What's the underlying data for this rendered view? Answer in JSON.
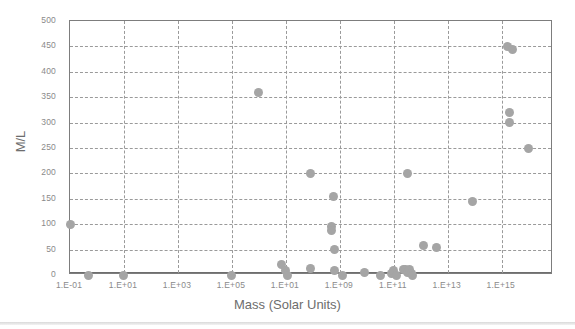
{
  "chart_data": {
    "type": "scatter",
    "title": "",
    "xlabel": "Mass (Solar Units)",
    "ylabel": "M/L",
    "grid": true,
    "legend": false,
    "x_tick_labels": [
      "1.E-01",
      "1.E+01",
      "1.E+03",
      "1.E+05",
      "1.E+01",
      "1.E+09",
      "1.E+11",
      "1.E+13",
      "1.E+15"
    ],
    "x_tick_exponents": [
      -1,
      1,
      3,
      5,
      7,
      9,
      11,
      13,
      15
    ],
    "y_tick_labels": [
      "0",
      "50",
      "100",
      "150",
      "200",
      "250",
      "300",
      "350",
      "400",
      "450",
      "500"
    ],
    "ylim": [
      0,
      500
    ],
    "xlim_exponents": [
      -1,
      16.9
    ],
    "marker_color": "#a5a5a5",
    "grid_color": "#9a9a9a",
    "axis_color": "#7d7d7d",
    "label_color": "#8a8a8a",
    "title_color": "#6d6d6d",
    "points": [
      {
        "xexp": -1.0,
        "y": 100
      },
      {
        "xexp": -0.3,
        "y": 0
      },
      {
        "xexp": 1.0,
        "y": 0
      },
      {
        "xexp": 5.0,
        "y": 0
      },
      {
        "xexp": 6.0,
        "y": 360
      },
      {
        "xexp": 6.85,
        "y": 20
      },
      {
        "xexp": 7.0,
        "y": 8
      },
      {
        "xexp": 7.05,
        "y": 0
      },
      {
        "xexp": 7.9,
        "y": 200
      },
      {
        "xexp": 7.9,
        "y": 12
      },
      {
        "xexp": 8.7,
        "y": 95
      },
      {
        "xexp": 8.7,
        "y": 88
      },
      {
        "xexp": 8.75,
        "y": 155
      },
      {
        "xexp": 8.8,
        "y": 50
      },
      {
        "xexp": 8.8,
        "y": 8
      },
      {
        "xexp": 9.1,
        "y": 0
      },
      {
        "xexp": 9.9,
        "y": 5
      },
      {
        "xexp": 10.5,
        "y": 0
      },
      {
        "xexp": 10.9,
        "y": 3
      },
      {
        "xexp": 11.0,
        "y": 8
      },
      {
        "xexp": 11.1,
        "y": 0
      },
      {
        "xexp": 11.35,
        "y": 10
      },
      {
        "xexp": 11.45,
        "y": 10
      },
      {
        "xexp": 11.5,
        "y": 5
      },
      {
        "xexp": 11.6,
        "y": 10
      },
      {
        "xexp": 11.65,
        "y": 3
      },
      {
        "xexp": 11.7,
        "y": 0
      },
      {
        "xexp": 11.5,
        "y": 200
      },
      {
        "xexp": 12.1,
        "y": 58
      },
      {
        "xexp": 12.6,
        "y": 55
      },
      {
        "xexp": 13.9,
        "y": 145
      },
      {
        "xexp": 15.2,
        "y": 450
      },
      {
        "xexp": 15.4,
        "y": 443
      },
      {
        "xexp": 15.3,
        "y": 320
      },
      {
        "xexp": 15.3,
        "y": 300
      },
      {
        "xexp": 16.0,
        "y": 250
      }
    ]
  },
  "axes": {
    "x_title": "Mass (Solar Units)",
    "y_title": "M/L"
  }
}
